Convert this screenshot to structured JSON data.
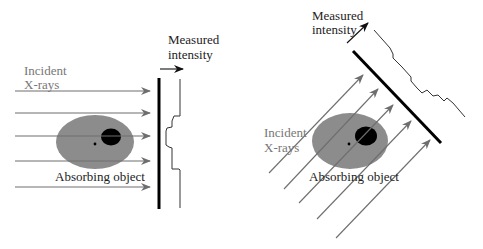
{
  "left_panel": {
    "incident_label_line1": "Incident",
    "incident_label_line2": "X-rays",
    "measured_label_line1": "Measured",
    "measured_label_line2": "intensity",
    "object_label": "Absorbing object"
  },
  "right_panel": {
    "incident_label_line1": "Incident",
    "incident_label_line2": "X-rays",
    "measured_label_line1": "Measured",
    "measured_label_line2": "intensity",
    "object_label": "Absorbing object"
  },
  "colors": {
    "arrow": "#6e6e6e",
    "object_fill": "#8c8c8c",
    "inclusion_fill": "#000000",
    "detector": "#000000",
    "profile": "#333333",
    "incident_text": "#777777",
    "text": "#222222"
  }
}
